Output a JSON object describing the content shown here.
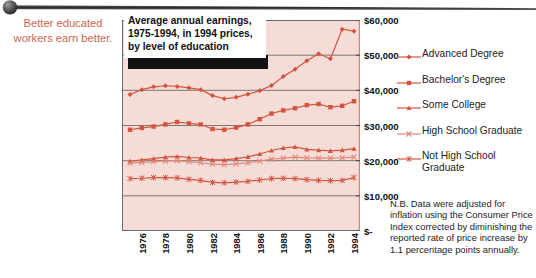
{
  "annotation": {
    "line1": "Better educated",
    "line2": "workers earn better.",
    "color": "#c9664f"
  },
  "title": {
    "line1": "Average annual earnings,",
    "line2": "1975-1994, in 1994 prices,",
    "line3": "by level of education"
  },
  "footnote": {
    "text": "N.B. Data were adjusted for inflation using the Consumer Price Index corrected by diminishing the reported rate of price increase by 1.1 percentage points annually."
  },
  "legend": [
    {
      "label": "Advanced Degree",
      "marker": "diamond-marker-icon",
      "color": "#d2543f"
    },
    {
      "label": "Bachelor's Degree",
      "marker": "square-marker-icon",
      "color": "#d2543f"
    },
    {
      "label": "Some College",
      "marker": "triangle-marker-icon",
      "color": "#d2543f"
    },
    {
      "label": "High School Graduate",
      "marker": "x-marker-icon",
      "color": "#e08878"
    },
    {
      "label": "Not High School Graduate",
      "marker": "star-marker-icon",
      "color": "#d2543f"
    }
  ],
  "chart_data": {
    "type": "line",
    "title": "Average annual earnings, 1975-1994, in 1994 prices, by level of education",
    "xlabel": "",
    "ylabel": "",
    "plot_background": "#f5dcd6",
    "grid": true,
    "legend_position": "right",
    "ylim": [
      0,
      60000
    ],
    "yticks": [
      0,
      10000,
      20000,
      30000,
      40000,
      50000,
      60000
    ],
    "ytick_labels": [
      "$-",
      "$10,000",
      "$20,000",
      "$30,000",
      "$40,000",
      "$50,000",
      "$60,000"
    ],
    "x": [
      1975,
      1976,
      1977,
      1978,
      1979,
      1980,
      1981,
      1982,
      1983,
      1984,
      1985,
      1986,
      1987,
      1988,
      1989,
      1990,
      1991,
      1992,
      1993,
      1994
    ],
    "xtick_labels": [
      "1976",
      "1978",
      "1980",
      "1982",
      "1984",
      "1986",
      "1988",
      "1990",
      "1992",
      "1994"
    ],
    "xticks": [
      1976,
      1978,
      1980,
      1982,
      1984,
      1986,
      1988,
      1990,
      1992,
      1994
    ],
    "series": [
      {
        "name": "Advanced Degree",
        "marker": "diamond",
        "color": "#d2543f",
        "values": [
          38800,
          40200,
          41000,
          41300,
          41100,
          40700,
          40200,
          38500,
          37600,
          38000,
          38900,
          39900,
          41400,
          43900,
          46000,
          48400,
          50400,
          49000,
          57400,
          56800
        ]
      },
      {
        "name": "Bachelor's Degree",
        "marker": "square",
        "color": "#d2543f",
        "values": [
          28800,
          29300,
          29700,
          30300,
          31000,
          30600,
          30300,
          29000,
          28800,
          29400,
          30300,
          31800,
          33400,
          34300,
          34900,
          35800,
          36100,
          35200,
          35600,
          36900
        ]
      },
      {
        "name": "Some College",
        "marker": "triangle",
        "color": "#d2543f",
        "values": [
          19800,
          20200,
          20600,
          21000,
          21200,
          20900,
          20700,
          20200,
          20200,
          20600,
          21100,
          21900,
          22900,
          23600,
          23900,
          23200,
          23000,
          22800,
          23000,
          23400
        ]
      },
      {
        "name": "High School Graduate",
        "marker": "x",
        "color": "#e08878",
        "values": [
          19300,
          19500,
          19700,
          19900,
          20000,
          19700,
          19400,
          19000,
          18900,
          19100,
          19400,
          19900,
          20400,
          20700,
          21000,
          20800,
          20700,
          20700,
          20800,
          21000
        ]
      },
      {
        "name": "Not High School Graduate",
        "marker": "star",
        "color": "#d2543f",
        "values": [
          14900,
          15000,
          15200,
          15200,
          15100,
          14700,
          14400,
          13800,
          13700,
          13900,
          14100,
          14500,
          14900,
          15000,
          14900,
          14600,
          14400,
          14300,
          14400,
          15200
        ]
      }
    ]
  }
}
